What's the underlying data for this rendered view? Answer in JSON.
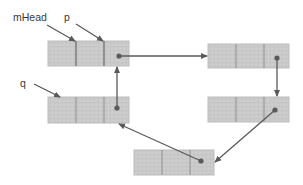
{
  "diagram": {
    "type": "linked-list",
    "colors": {
      "node_fill": "#c9c9c9",
      "node_border": "#bdbdbd",
      "cell_divider": "#8f8f8f",
      "arrow": "#5a5a5a",
      "label": "#3a3a3a"
    },
    "labels": {
      "mhead": "mHead",
      "p": "p",
      "q": "q"
    },
    "nodes": [
      {
        "id": "node-1",
        "x": 48,
        "y": 41,
        "w": 81,
        "h": 25,
        "dividers": [
          76,
          104
        ],
        "dot": [
          119,
          56
        ]
      },
      {
        "id": "node-2",
        "x": 208,
        "y": 44,
        "w": 81,
        "h": 24,
        "dividers": [
          236,
          264
        ],
        "dot": [
          277,
          58
        ]
      },
      {
        "id": "node-3",
        "x": 208,
        "y": 97,
        "w": 81,
        "h": 25,
        "dividers": [
          236,
          264
        ],
        "dot": [
          275,
          110
        ]
      },
      {
        "id": "node-4",
        "x": 134,
        "y": 150,
        "w": 80,
        "h": 25,
        "dividers": [
          162,
          190
        ],
        "dot": [
          201,
          161
        ]
      },
      {
        "id": "node-5",
        "x": 48,
        "y": 97,
        "w": 81,
        "h": 26,
        "dividers": [
          76,
          104
        ],
        "dot": [
          117,
          108
        ]
      }
    ],
    "links": [
      {
        "from": "node-1",
        "to": "node-2"
      },
      {
        "from": "node-2",
        "to": "node-3"
      },
      {
        "from": "node-3",
        "to": "node-4"
      },
      {
        "from": "node-4",
        "to": "node-5"
      },
      {
        "from": "node-5",
        "to": "node-1"
      }
    ],
    "pointers": [
      {
        "label": "mHead",
        "target": "node-1"
      },
      {
        "label": "p",
        "target": "node-1"
      },
      {
        "label": "q",
        "target": "node-5"
      }
    ]
  }
}
